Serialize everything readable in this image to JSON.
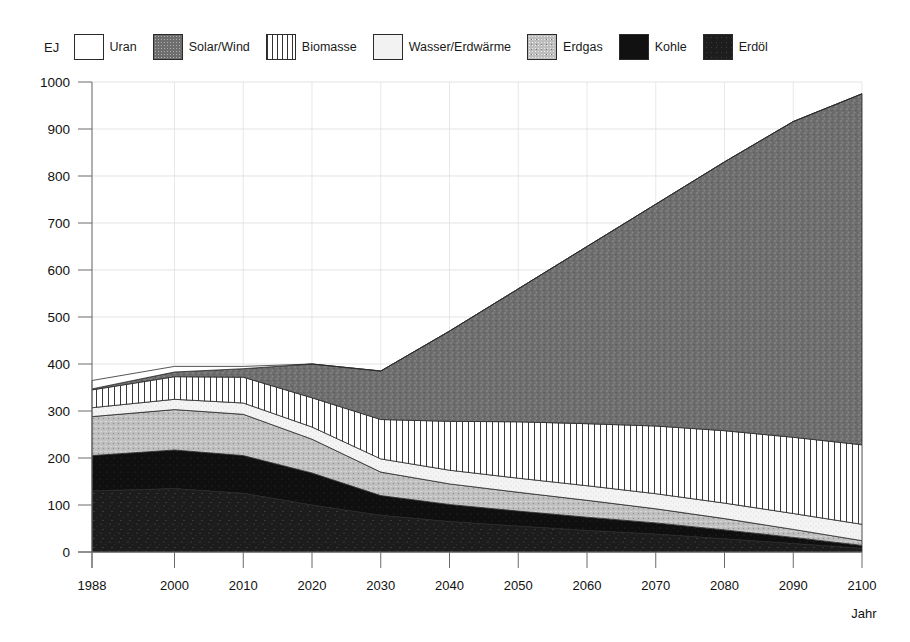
{
  "chart_data": {
    "type": "area",
    "title": "",
    "xlabel": "Jahr",
    "ylabel": "EJ",
    "unit": "EJ",
    "stacked": true,
    "grid": true,
    "legend_position": "top",
    "xlim": [
      1988,
      2100
    ],
    "ylim": [
      0,
      1000
    ],
    "x": [
      1988,
      2000,
      2010,
      2020,
      2030,
      2040,
      2050,
      2060,
      2070,
      2080,
      2090,
      2100
    ],
    "xticks": [
      "1988",
      "2000",
      "2010",
      "2020",
      "2030",
      "2040",
      "2050",
      "2060",
      "2070",
      "2080",
      "2090",
      "2100"
    ],
    "yticks": [
      "0",
      "100",
      "200",
      "300",
      "400",
      "500",
      "600",
      "700",
      "800",
      "900",
      "1000"
    ],
    "series": [
      {
        "name": "Erdöl",
        "fill": "erdoel",
        "color": "#1d1d1d",
        "values": [
          130,
          135,
          125,
          100,
          78,
          65,
          55,
          46,
          38,
          28,
          18,
          8
        ]
      },
      {
        "name": "Kohle",
        "fill": "kohle",
        "color": "#111111",
        "values": [
          75,
          82,
          80,
          68,
          42,
          36,
          32,
          28,
          24,
          19,
          13,
          6
        ]
      },
      {
        "name": "Erdgas",
        "fill": "erdgas",
        "color": "#bdbdbd",
        "values": [
          83,
          86,
          88,
          72,
          50,
          44,
          40,
          36,
          30,
          24,
          17,
          10
        ]
      },
      {
        "name": "Wasser/Erdwärme",
        "fill": "wasser",
        "color": "#f2f2f2",
        "values": [
          19,
          22,
          24,
          26,
          28,
          29,
          30,
          31,
          32,
          33,
          34,
          35
        ]
      },
      {
        "name": "Biomasse",
        "fill": "biomasse",
        "color": "#ffffff",
        "values": [
          38,
          48,
          55,
          62,
          84,
          104,
          120,
          132,
          144,
          154,
          162,
          169
        ]
      },
      {
        "name": "Solar/Wind",
        "fill": "solar",
        "color": "#6e6e6e",
        "values": [
          2,
          10,
          18,
          72,
          103,
          192,
          283,
          377,
          472,
          572,
          672,
          747
        ]
      },
      {
        "name": "Uran",
        "fill": "uran",
        "color": "#ffffff",
        "values": [
          18,
          12,
          5,
          0,
          0,
          0,
          0,
          0,
          0,
          0,
          0,
          0
        ]
      }
    ],
    "totals": [
      345,
      395,
      395,
      400,
      385,
      470,
      560,
      650,
      740,
      830,
      916,
      975
    ]
  },
  "legend": {
    "unit_label": "EJ",
    "items": [
      {
        "label": "Uran",
        "fill": "uran"
      },
      {
        "label": "Solar/Wind",
        "fill": "solar"
      },
      {
        "label": "Biomasse",
        "fill": "biomasse"
      },
      {
        "label": "Wasser/Erdwärme",
        "fill": "wasser"
      },
      {
        "label": "Erdgas",
        "fill": "erdgas"
      },
      {
        "label": "Kohle",
        "fill": "kohle"
      },
      {
        "label": "Erdöl",
        "fill": "erdoel"
      }
    ]
  },
  "axes": {
    "x_axis_name": "Jahr",
    "y_axis_name": "EJ"
  }
}
